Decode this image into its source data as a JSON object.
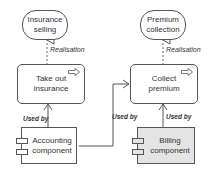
{
  "nodes": {
    "insurance_selling": {
      "label_line1": "Insurance",
      "label_line2": "selling",
      "type": "business-service"
    },
    "premium_collection": {
      "label_line1": "Premium",
      "label_line2": "collection",
      "type": "business-service"
    },
    "take_out_insurance": {
      "label_line1": "Take out",
      "label_line2": "insurance",
      "type": "business-process"
    },
    "collect_premium": {
      "label_line1": "Collect",
      "label_line2": "premium",
      "type": "business-process"
    },
    "accounting_component": {
      "label_line1": "Accounting",
      "label_line2": "component",
      "type": "application-component"
    },
    "billing_component": {
      "label_line1": "Billing",
      "label_line2": "component",
      "type": "application-component"
    }
  },
  "relations": {
    "realisation_left": "Realisation",
    "realisation_right": "Realisation",
    "used_by_accounting_takeout": "Used by",
    "used_by_accounting_collect": "Used by",
    "used_by_billing_collect": "Used by"
  },
  "colors": {
    "stroke": "#555555",
    "billing_fill": "#e4e4e4",
    "default_fill": "#ffffff"
  }
}
